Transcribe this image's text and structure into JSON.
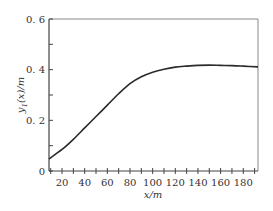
{
  "chart_data": {
    "type": "line",
    "title": "",
    "xlabel": "x/m",
    "ylabel": "y1(x)/m",
    "ylabel_parts": {
      "var": "y",
      "sub": "1",
      "rest": "(x)/m"
    },
    "xlim": [
      8.5,
      193
    ],
    "ylim": [
      0,
      0.6
    ],
    "x_ticks": [
      20,
      40,
      60,
      80,
      100,
      120,
      140,
      160,
      180
    ],
    "x_tick_labels": [
      "20",
      "40",
      "60",
      "80",
      "100",
      "120",
      "140",
      "160",
      "180"
    ],
    "y_ticks": [
      0,
      0.2,
      0.4,
      0.6
    ],
    "y_tick_labels": [
      "0",
      "0. 2",
      "0. 4",
      "0. 6"
    ],
    "grid": false,
    "legend": null,
    "series": [
      {
        "name": "y1(x)",
        "color": "#2a2a2a",
        "x": [
          8.5,
          20,
          30,
          40,
          50,
          60,
          70,
          80,
          90,
          100,
          110,
          120,
          130,
          140,
          150,
          160,
          170,
          180,
          193
        ],
        "y": [
          0.048,
          0.085,
          0.125,
          0.17,
          0.215,
          0.26,
          0.305,
          0.345,
          0.372,
          0.39,
          0.402,
          0.41,
          0.414,
          0.417,
          0.418,
          0.417,
          0.416,
          0.414,
          0.411
        ]
      }
    ]
  },
  "colors": {
    "axis": "#444444",
    "frame": "#888888",
    "line": "#2a2a2a"
  }
}
